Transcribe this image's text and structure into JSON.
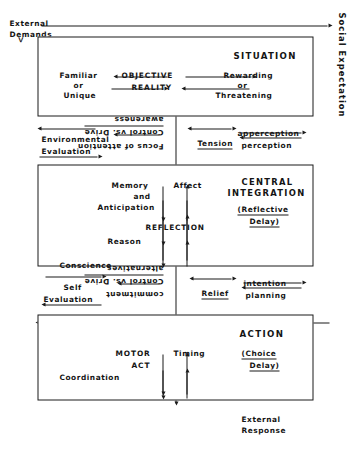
{
  "figure": {
    "title": "THE \"ACT AS A UNIT\"",
    "left_axis_label": "Social Expectation",
    "right_axis_label": "Individual Expectation (of self and others)",
    "input_label_line1": "External",
    "input_label_line2": "Demands",
    "output_label_line1": "External",
    "output_label_line2": "Response"
  },
  "stages": {
    "situation": {
      "heading": "SITUATION",
      "items": [
        {
          "text_line1": "Rewarding",
          "text_line2": "or",
          "text_line3": "Threatening"
        },
        {
          "text_line1": "OBJECTIVE",
          "text_line2": "REALITY"
        },
        {
          "text_line1": "Familiar",
          "text_line2": "or",
          "text_line3": "Unique"
        }
      ]
    },
    "central_integration": {
      "heading_line1": "CENTRAL",
      "heading_line2": "INTEGRATION",
      "subheading_line1": "(Reflective",
      "subheading_line2": "Delay)",
      "items": [
        {
          "text": "Affect"
        },
        {
          "text_line1": "Memory",
          "text_line2": "and",
          "text_line3": "Anticipation"
        },
        {
          "text": "REFLECTION"
        },
        {
          "text": "Reason"
        },
        {
          "text": "Conscience"
        }
      ]
    },
    "action": {
      "heading": "ACTION",
      "subheading_line1": "(Choice",
      "subheading_line2": "Delay)",
      "items": [
        {
          "text": "Timing"
        },
        {
          "text_line1": "MOTOR",
          "text_line2": "ACT"
        },
        {
          "text": "Coordination"
        }
      ]
    }
  },
  "connectors": {
    "situation_to_central": {
      "top_upper": "apperception",
      "top_lower": "perception",
      "tension": "Tension",
      "mid_upper": "awareness",
      "mid_center": "Control vs. Drive",
      "mid_lower": "Focus of attention",
      "bottom_line1": "Environmental",
      "bottom_line2": "Evaluation"
    },
    "central_to_action": {
      "top_upper": "intention",
      "top_lower": "planning",
      "relief": "Relief",
      "mid_upper": "alternatives",
      "mid_center": "Control vs. Drive",
      "mid_lower": "commitment",
      "bottom_line1": "Self",
      "bottom_line2": "Evaluation"
    }
  }
}
